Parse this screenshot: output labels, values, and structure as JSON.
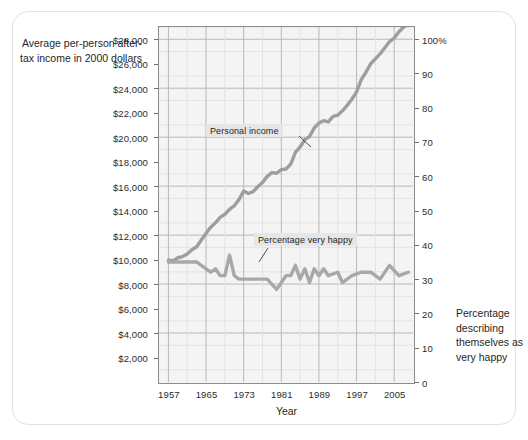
{
  "chart_data": {
    "type": "line",
    "title": "",
    "xlabel": "Year",
    "ylabel_left": "Average per-person after-tax income in 2000 dollars",
    "ylabel_right": "Percentage describing themselves as very happy",
    "xlim": [
      1955,
      2009
    ],
    "xticks": [
      1957,
      1965,
      1973,
      1981,
      1989,
      1997,
      2005
    ],
    "xticklabels": [
      "1957",
      "1965",
      "1973",
      "1981",
      "1989",
      "1997",
      "2005"
    ],
    "ylim_left": [
      0,
      29000
    ],
    "yticks_left": [
      2000,
      4000,
      6000,
      8000,
      10000,
      12000,
      14000,
      16000,
      18000,
      20000,
      22000,
      24000,
      26000,
      28000
    ],
    "yticklabels_left": [
      "$2,000",
      "$4,000",
      "$6,000",
      "$8,000",
      "$10,000",
      "$12,000",
      "$14,000",
      "$16,000",
      "$18,000",
      "$20,000",
      "$22,000",
      "$24,000",
      "$26,000",
      "$28,000"
    ],
    "ylim_right": [
      0,
      103.5
    ],
    "yticks_right": [
      0,
      10,
      20,
      30,
      40,
      50,
      60,
      70,
      80,
      90,
      100
    ],
    "yticklabels_right": [
      "0",
      "10",
      "20",
      "30",
      "40",
      "50",
      "60",
      "70",
      "80",
      "90",
      "100%"
    ],
    "grid": true,
    "legend_position": "inline-annotations",
    "series": [
      {
        "name": "Personal income",
        "axis": "left",
        "color": "#9e9e9e",
        "annotation": "Personal income",
        "x": [
          1957,
          1958,
          1959,
          1960,
          1961,
          1962,
          1963,
          1964,
          1965,
          1966,
          1967,
          1968,
          1969,
          1970,
          1971,
          1972,
          1973,
          1974,
          1975,
          1976,
          1977,
          1978,
          1979,
          1980,
          1981,
          1982,
          1983,
          1984,
          1985,
          1986,
          1987,
          1988,
          1989,
          1990,
          1991,
          1992,
          1993,
          1994,
          1995,
          1996,
          1997,
          1998,
          1999,
          2000,
          2001,
          2002,
          2003,
          2004,
          2005,
          2006,
          2007,
          2008
        ],
        "y": [
          9950,
          9900,
          10150,
          10250,
          10450,
          10800,
          11050,
          11600,
          12150,
          12650,
          13000,
          13450,
          13700,
          14100,
          14400,
          14900,
          15600,
          15400,
          15550,
          15950,
          16300,
          16800,
          17100,
          17050,
          17350,
          17400,
          17800,
          18750,
          19200,
          19800,
          20050,
          20750,
          21150,
          21350,
          21250,
          21700,
          21800,
          22150,
          22600,
          23100,
          23700,
          24700,
          25300,
          26000,
          26400,
          26800,
          27300,
          27800,
          28100,
          28600,
          29000,
          29200
        ]
      },
      {
        "name": "Percentage very happy",
        "axis": "right",
        "color": "#a8a8a8",
        "annotation": "Percentage very happy",
        "x": [
          1957,
          1960,
          1963,
          1965,
          1966,
          1967,
          1968,
          1969,
          1970,
          1971,
          1972,
          1973,
          1974,
          1975,
          1976,
          1977,
          1978,
          1980,
          1982,
          1983,
          1984,
          1985,
          1986,
          1987,
          1988,
          1989,
          1990,
          1991,
          1993,
          1994,
          1996,
          1998,
          2000,
          2002,
          2004,
          2006,
          2008
        ],
        "y": [
          35,
          35,
          35,
          33,
          32,
          33,
          31,
          31,
          37,
          31,
          30,
          30,
          30,
          30,
          30,
          30,
          30,
          27,
          31,
          31,
          34,
          30,
          33,
          29,
          33,
          31,
          33,
          31,
          32,
          29,
          31,
          32,
          32,
          30,
          34,
          31,
          32
        ]
      }
    ]
  },
  "labels": {
    "y_left_title": "Average per-person after-tax income in 2000 dollars",
    "y_right_title": "Percentage describing themselves as very happy",
    "x_title": "Year",
    "annotation_income": "Personal income",
    "annotation_happy": "Percentage very happy"
  },
  "colors": {
    "income_line": "#9e9e9e",
    "happy_line": "#a8a8a8",
    "plot_background": "#f4f4f4",
    "plot_border": "#8c8c8c",
    "grid_major": "#b8b8b8",
    "grid_minor": "#e3e3e3",
    "card_border": "#e2e2e2",
    "text": "#1f1f1f"
  }
}
